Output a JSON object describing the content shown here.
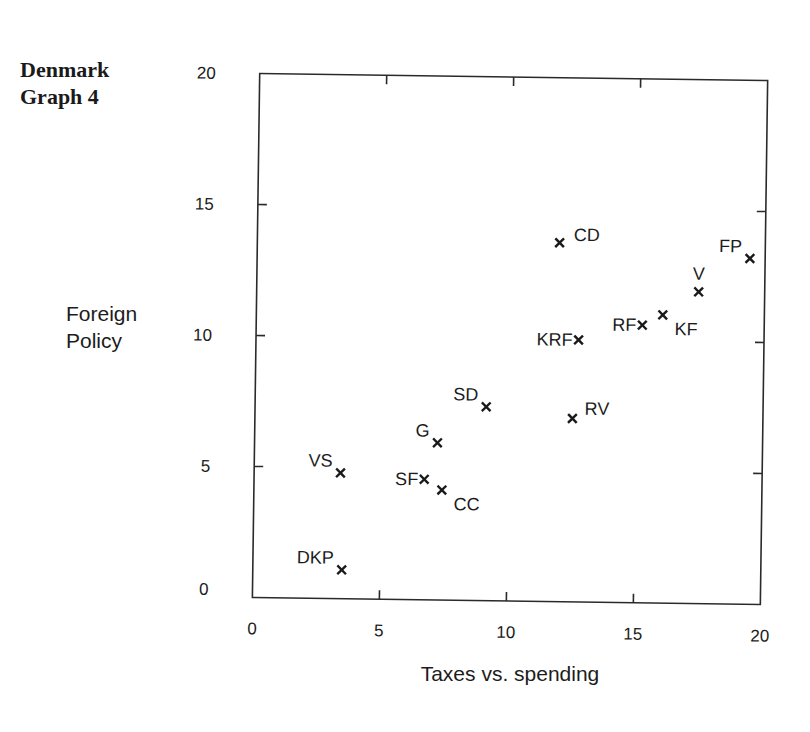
{
  "header": {
    "line1": "Denmark",
    "line2": "Graph 4"
  },
  "chart_data": {
    "type": "scatter",
    "title": "Denmark Graph 4",
    "xlabel": "Taxes vs. spending",
    "ylabel": "Foreign Policy",
    "ylabel_lines": [
      "Foreign",
      "Policy"
    ],
    "xlim": [
      0,
      20
    ],
    "ylim": [
      0,
      20
    ],
    "xticks": [
      0,
      5,
      10,
      15,
      20
    ],
    "yticks": [
      0,
      5,
      10,
      15,
      20
    ],
    "grid": false,
    "legend": null,
    "marker": "x",
    "points": [
      {
        "label": "CD",
        "x": 11.9,
        "y": 13.7,
        "label_pos": "right"
      },
      {
        "label": "FP",
        "x": 19.4,
        "y": 13.2,
        "label_pos": "above-left"
      },
      {
        "label": "V",
        "x": 17.4,
        "y": 11.9,
        "label_pos": "above"
      },
      {
        "label": "KF",
        "x": 16.0,
        "y": 11.0,
        "label_pos": "below-right"
      },
      {
        "label": "RF",
        "x": 15.2,
        "y": 10.6,
        "label_pos": "left"
      },
      {
        "label": "KRF",
        "x": 12.7,
        "y": 10.0,
        "label_pos": "left"
      },
      {
        "label": "SD",
        "x": 9.1,
        "y": 7.4,
        "label_pos": "above-left"
      },
      {
        "label": "RV",
        "x": 12.5,
        "y": 7.0,
        "label_pos": "above-right"
      },
      {
        "label": "G",
        "x": 7.2,
        "y": 6.0,
        "label_pos": "above-left"
      },
      {
        "label": "VS",
        "x": 3.4,
        "y": 4.8,
        "label_pos": "above-left"
      },
      {
        "label": "SF",
        "x": 6.7,
        "y": 4.6,
        "label_pos": "left"
      },
      {
        "label": "CC",
        "x": 7.4,
        "y": 4.2,
        "label_pos": "below-right"
      },
      {
        "label": "DKP",
        "x": 3.5,
        "y": 1.1,
        "label_pos": "above-left"
      }
    ]
  }
}
